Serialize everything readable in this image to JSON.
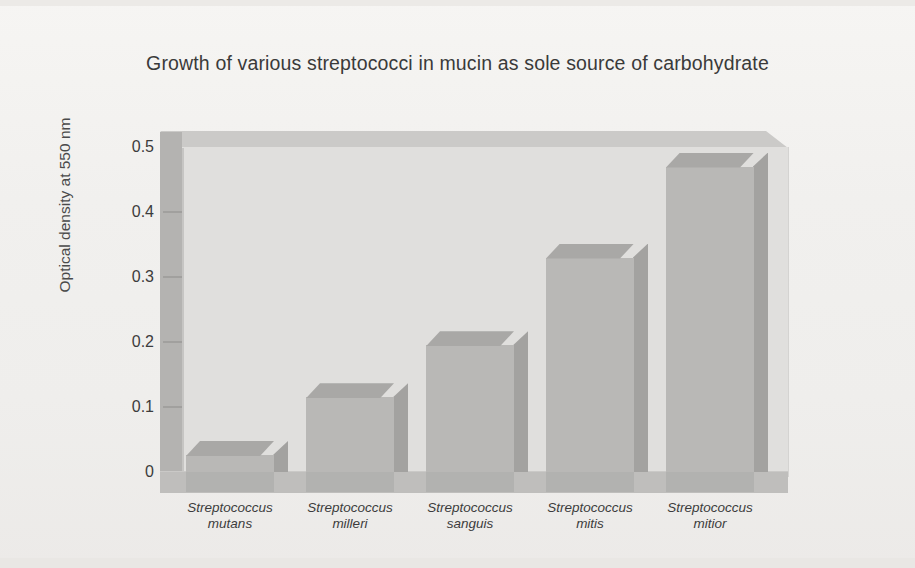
{
  "figure": {
    "background_color": "#f1f0ee",
    "bar_color": "#b9b8b6",
    "wall_color": "#e0dfdd",
    "axis_color": "#b4b3b1"
  },
  "chart_data": {
    "type": "bar",
    "title": "Growth of various streptococci in mucin as sole source of carbohydrate",
    "xlabel": "",
    "ylabel": "Optical density at 550 nm",
    "ylim": [
      0,
      0.5
    ],
    "ytick_labels": [
      "0.5",
      "0.4",
      "0.3",
      "0.2",
      "0.1",
      "0"
    ],
    "yticks": [
      0.5,
      0.4,
      0.3,
      0.2,
      0.1,
      0
    ],
    "grid": false,
    "legend": false,
    "three_d": true,
    "categories": [
      "Streptococcus mutans",
      "Streptococcus milleri",
      "Streptococcus sanguis",
      "Streptococcus mitis",
      "Streptococcus mitior"
    ],
    "category_lines": [
      {
        "genus": "Streptococcus",
        "species": "mutans"
      },
      {
        "genus": "Streptococcus",
        "species": "milleri"
      },
      {
        "genus": "Streptococcus",
        "species": "sanguis"
      },
      {
        "genus": "Streptococcus",
        "species": "mitis"
      },
      {
        "genus": "Streptococcus",
        "species": "mitior"
      }
    ],
    "values": [
      0.026,
      0.115,
      0.195,
      0.33,
      0.47
    ]
  }
}
